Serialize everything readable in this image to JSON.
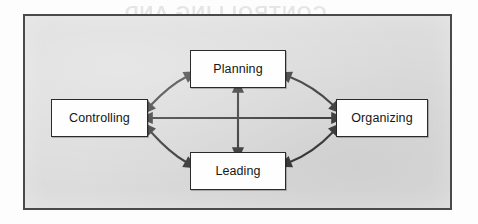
{
  "figure": {
    "type": "cycle-diagram",
    "background_color": "#dcdcdc",
    "frame_border_color": "#4a4a4a",
    "box_fill_color": "#fefefe",
    "box_border_color": "#2a2a2a",
    "arrow_color": "#3a3a3a",
    "nodes": [
      {
        "id": "planning",
        "label": "Planning",
        "position": "top"
      },
      {
        "id": "organizing",
        "label": "Organizing",
        "position": "right"
      },
      {
        "id": "leading",
        "label": "Leading",
        "position": "bottom"
      },
      {
        "id": "controlling",
        "label": "Controlling",
        "position": "left"
      }
    ],
    "connections": [
      {
        "from": "controlling",
        "to": "planning",
        "style": "double-headed",
        "shape": "curved"
      },
      {
        "from": "planning",
        "to": "organizing",
        "style": "double-headed",
        "shape": "curved"
      },
      {
        "from": "controlling",
        "to": "leading",
        "style": "double-headed",
        "shape": "curved"
      },
      {
        "from": "leading",
        "to": "organizing",
        "style": "double-headed",
        "shape": "curved"
      },
      {
        "from": "controlling",
        "to": "organizing",
        "style": "double-headed",
        "shape": "straight"
      },
      {
        "from": "planning",
        "to": "leading",
        "style": "double-headed",
        "shape": "straight"
      }
    ]
  },
  "bleed_through": {
    "visible_text": "CONTROLLING AND\nMAN"
  }
}
